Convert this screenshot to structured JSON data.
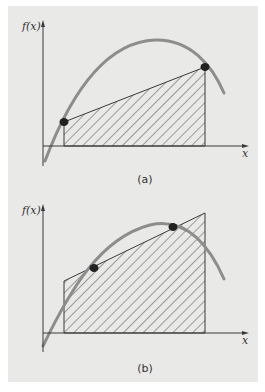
{
  "figure": {
    "background_color": "#e9e9e7",
    "curve_color": "#8d8d8d",
    "line_color": "#3a3a3a",
    "point_color": "#222222"
  },
  "panels": [
    {
      "id": "a",
      "caption": "(a)",
      "y_axis_label": "f(x)",
      "x_axis_label": "x",
      "description": "Trapezoid connecting f(a) and f(b) on curve — trapezoidal rule with endpoints"
    },
    {
      "id": "b",
      "caption": "(b)",
      "y_axis_label": "f(x)",
      "x_axis_label": "x",
      "description": "Trapezoid through two interior points on curve — Gauss quadrature style"
    }
  ]
}
